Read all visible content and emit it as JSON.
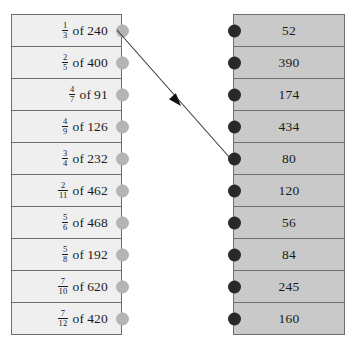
{
  "exercise": {
    "left_column": {
      "name": "fraction-problems",
      "rows": [
        {
          "numerator": "1",
          "denominator": "3",
          "of": "of",
          "operand": "240"
        },
        {
          "numerator": "2",
          "denominator": "5",
          "of": "of",
          "operand": "400"
        },
        {
          "numerator": "4",
          "denominator": "7",
          "of": "of",
          "operand": "91"
        },
        {
          "numerator": "4",
          "denominator": "9",
          "of": "of",
          "operand": "126"
        },
        {
          "numerator": "3",
          "denominator": "4",
          "of": "of",
          "operand": "232"
        },
        {
          "numerator": "2",
          "denominator": "11",
          "of": "of",
          "operand": "462"
        },
        {
          "numerator": "5",
          "denominator": "6",
          "of": "of",
          "operand": "468"
        },
        {
          "numerator": "5",
          "denominator": "8",
          "of": "of",
          "operand": "192"
        },
        {
          "numerator": "7",
          "denominator": "10",
          "of": "of",
          "operand": "620"
        },
        {
          "numerator": "7",
          "denominator": "12",
          "of": "of",
          "operand": "420"
        }
      ]
    },
    "right_column": {
      "name": "answer-choices",
      "values": [
        "52",
        "390",
        "174",
        "434",
        "80",
        "120",
        "56",
        "84",
        "245",
        "160"
      ]
    },
    "connection": {
      "from_row": 1,
      "to_row": 5,
      "start_x": 117,
      "start_y": 30,
      "end_x": 230,
      "end_y": 158,
      "arrowhead_x": 181,
      "arrowhead_y": 106
    },
    "colors": {
      "left_cell": "#efefef",
      "right_cell": "#c9c9c9",
      "border": "#6e6e6e",
      "dot_left": "#b4b4b4",
      "dot_right": "#2a2a2a",
      "line": "#3a3a3a",
      "text": "#1a1a1a"
    }
  }
}
